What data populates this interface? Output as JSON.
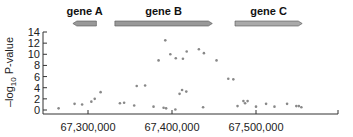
{
  "chart_data": {
    "type": "scatter",
    "title": "",
    "xlabel": "",
    "ylabel": "-log10 P-value",
    "ylabel_parts": {
      "main": "–log",
      "sub": "10",
      "rest": " P-value"
    },
    "xlim": [
      67245000,
      67550000
    ],
    "ylim": [
      0,
      14
    ],
    "yticks": [
      0,
      2,
      4,
      6,
      8,
      10,
      12,
      14
    ],
    "xticks": [
      67300000,
      67400000,
      67500000
    ],
    "xtick_labels": [
      "67,300,000",
      "67,400,000",
      "67,500,000"
    ],
    "grid": false,
    "point_color": "#888888",
    "genes": [
      {
        "name": "gene A",
        "start": 67282000,
        "end": 67310000,
        "strand": "-",
        "color": "#999999"
      },
      {
        "name": "gene B",
        "start": 67332000,
        "end": 67448000,
        "strand": "+",
        "color": "#999999"
      },
      {
        "name": "gene C",
        "start": 67475000,
        "end": 67555000,
        "strand": "+",
        "color": "#aaaaaa"
      }
    ],
    "points": [
      {
        "x": 67265000,
        "y": 0.3
      },
      {
        "x": 67284000,
        "y": 1.1
      },
      {
        "x": 67293000,
        "y": 1.0
      },
      {
        "x": 67304000,
        "y": 1.5
      },
      {
        "x": 67308000,
        "y": 2.0
      },
      {
        "x": 67315000,
        "y": 3.2
      },
      {
        "x": 67338000,
        "y": 1.2
      },
      {
        "x": 67343000,
        "y": 1.3
      },
      {
        "x": 67355000,
        "y": 0.8
      },
      {
        "x": 67358000,
        "y": 4.3
      },
      {
        "x": 67368000,
        "y": 4.4
      },
      {
        "x": 67378000,
        "y": 0.6
      },
      {
        "x": 67384000,
        "y": 8.9
      },
      {
        "x": 67390000,
        "y": 0.4
      },
      {
        "x": 67392000,
        "y": 12.5
      },
      {
        "x": 67393000,
        "y": 0.3
      },
      {
        "x": 67398000,
        "y": 10.0
      },
      {
        "x": 67404000,
        "y": 0.1
      },
      {
        "x": 67404500,
        "y": 9.3
      },
      {
        "x": 67409000,
        "y": 2.9
      },
      {
        "x": 67412000,
        "y": 3.6
      },
      {
        "x": 67413000,
        "y": 9.2
      },
      {
        "x": 67417000,
        "y": 3.3
      },
      {
        "x": 67417500,
        "y": 10.5
      },
      {
        "x": 67432000,
        "y": 10.9
      },
      {
        "x": 67437000,
        "y": 0.5
      },
      {
        "x": 67438000,
        "y": 10.2
      },
      {
        "x": 67453000,
        "y": 8.9
      },
      {
        "x": 67467000,
        "y": 5.6
      },
      {
        "x": 67473000,
        "y": 5.5
      },
      {
        "x": 67478000,
        "y": 0.7
      },
      {
        "x": 67485000,
        "y": 1.6
      },
      {
        "x": 67487000,
        "y": 1.2
      },
      {
        "x": 67490000,
        "y": 1.6
      },
      {
        "x": 67500000,
        "y": 0.6
      },
      {
        "x": 67512000,
        "y": 1.1
      },
      {
        "x": 67522000,
        "y": 0.6
      },
      {
        "x": 67537000,
        "y": 1.1
      },
      {
        "x": 67548000,
        "y": 0.7
      },
      {
        "x": 67551000,
        "y": 0.7
      },
      {
        "x": 67554000,
        "y": 0.5
      }
    ]
  }
}
